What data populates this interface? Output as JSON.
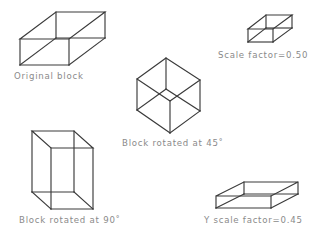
{
  "page": {
    "background_color": "#ffffff",
    "line_color": "#3a3a3a",
    "label_color": "#8a8a8a"
  },
  "figures": [
    {
      "id": "original-block",
      "label": "Original block",
      "description": "wireframe rectangular box in axonometric projection"
    },
    {
      "id": "scaled-block",
      "label": "Scale factor=0.50",
      "description": "small wireframe box, uniformly scaled down"
    },
    {
      "id": "rotated-45-block",
      "label": "Block rotated at 45°",
      "description": "wireframe box rotated forty five degrees"
    },
    {
      "id": "rotated-90-block",
      "label": "Block rotated at 90°",
      "description": "wireframe box rotated ninety degrees, tall orientation"
    },
    {
      "id": "y-scaled-block",
      "label": "Y scale factor=0.45",
      "description": "flattened wireframe box scaled on the Y axis"
    }
  ],
  "captions": {
    "original": "Original block",
    "scale_factor": "Scale factor=0.50",
    "rotated_45": "Block rotated at 45˚",
    "rotated_90": "Block rotated at 90˚",
    "y_scale_factor": "Y scale factor=0.45"
  }
}
